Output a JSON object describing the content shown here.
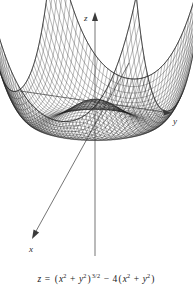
{
  "figure": {
    "caption_text": "z = (x^2 + y^2)^(3/2) - 4(x^2 + y^2)",
    "axes": {
      "z_label": "z",
      "y_label": "y",
      "x_label": "x"
    },
    "colors": {
      "background": "#ffffff",
      "mesh": "#1c1c1c",
      "axis": "#3a3a3a",
      "text": "#1a1a1a"
    }
  },
  "chart_data": {
    "type": "line",
    "subtitle": "",
    "render": "3d-wireframe-surface",
    "function": "z = (x^2 + y^2)^(3/2) - 4*(x^2 + y^2)",
    "xlabel": "x",
    "ylabel": "y",
    "zlabel": "z",
    "grid": false,
    "legend": null,
    "domain": {
      "x": [
        -4.0,
        4.0
      ],
      "y": [
        -4.0,
        4.0
      ],
      "samples_u": 46,
      "samples_v": 46
    },
    "zlim": [
      -9.48,
      64.0
    ],
    "critical_points": {
      "local_max_origin": {
        "r": 0.0,
        "z": 0.0
      },
      "ring_minimum": {
        "r": 2.3704,
        "z": -9.4815
      },
      "zero_ring": {
        "r": 4.0,
        "z": 0.0
      }
    },
    "corner_spike_value": 64.0,
    "projection": {
      "azimuth_deg": 28,
      "elevation_deg": 22,
      "origin_px": [
        95,
        100
      ],
      "x_axis_dir_px": [
        -0.62,
        0.38
      ],
      "y_axis_dir_px": [
        1.0,
        0.13
      ],
      "z_axis_dir_px": [
        0.0,
        -1.0
      ]
    },
    "axis_ticks": {
      "x": [],
      "y": [],
      "z": []
    },
    "annotations": [
      {
        "text": "z",
        "position_px": [
          88,
          17
        ]
      },
      {
        "text": "y",
        "position_px": [
          176,
          120
        ]
      },
      {
        "text": "x",
        "position_px": [
          33,
          248
        ]
      }
    ]
  }
}
